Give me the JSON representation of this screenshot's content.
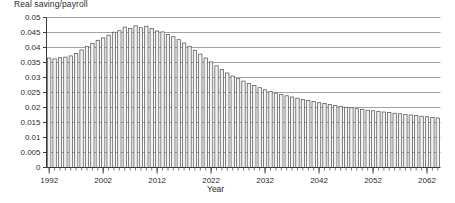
{
  "chart_data": {
    "type": "bar",
    "title": "Real saving/payroll",
    "subtitle": "",
    "xlabel": "Year",
    "ylabel": "",
    "grid": true,
    "legend": false,
    "ylim": [
      0,
      0.05
    ],
    "xlim": [
      1991.5,
      2064.5
    ],
    "ytick_labels": [
      "0",
      "0.005",
      "0.01",
      "0.015",
      "0.02",
      "0.025",
      "0.03",
      "0.035",
      "0.04",
      "0.045",
      "0.05"
    ],
    "ytick_values": [
      0,
      0.005,
      0.01,
      0.015,
      0.02,
      0.025,
      0.03,
      0.035,
      0.04,
      0.045,
      0.05
    ],
    "xtick_labels": [
      "1992",
      "2002",
      "2012",
      "2022",
      "2032",
      "2042",
      "2052",
      "2062"
    ],
    "xtick_values": [
      1992,
      2002,
      2012,
      2022,
      2032,
      2042,
      2052,
      2062
    ],
    "bar_fill": "#f2f2f2",
    "bar_stroke": "#4d4d4d",
    "grid_color": "#8c8c8c",
    "axis_color": "#3a3a3a",
    "categories": [
      1992,
      1993,
      1994,
      1995,
      1996,
      1997,
      1998,
      1999,
      2000,
      2001,
      2002,
      2003,
      2004,
      2005,
      2006,
      2007,
      2008,
      2009,
      2010,
      2011,
      2012,
      2013,
      2014,
      2015,
      2016,
      2017,
      2018,
      2019,
      2020,
      2021,
      2022,
      2023,
      2024,
      2025,
      2026,
      2027,
      2028,
      2029,
      2030,
      2031,
      2032,
      2033,
      2034,
      2035,
      2036,
      2037,
      2038,
      2039,
      2040,
      2041,
      2042,
      2043,
      2044,
      2045,
      2046,
      2047,
      2048,
      2049,
      2050,
      2051,
      2052,
      2053,
      2054,
      2055,
      2056,
      2057,
      2058,
      2059,
      2060,
      2061,
      2062,
      2063,
      2064
    ],
    "values": [
      0.0365,
      0.0362,
      0.0366,
      0.0368,
      0.0372,
      0.038,
      0.0392,
      0.0404,
      0.0414,
      0.0424,
      0.0432,
      0.0441,
      0.0451,
      0.0456,
      0.0468,
      0.0463,
      0.0472,
      0.0466,
      0.0471,
      0.0463,
      0.0455,
      0.0452,
      0.0443,
      0.0436,
      0.0426,
      0.0415,
      0.0404,
      0.0391,
      0.0378,
      0.0365,
      0.0352,
      0.0339,
      0.0327,
      0.0315,
      0.0305,
      0.0296,
      0.0288,
      0.028,
      0.0273,
      0.0266,
      0.0259,
      0.0253,
      0.0248,
      0.0243,
      0.0239,
      0.0235,
      0.0231,
      0.0227,
      0.0223,
      0.022,
      0.0216,
      0.0213,
      0.021,
      0.0207,
      0.0204,
      0.0201,
      0.0199,
      0.0196,
      0.0194,
      0.0191,
      0.0189,
      0.0187,
      0.0185,
      0.0183,
      0.0181,
      0.0179,
      0.0177,
      0.0175,
      0.0173,
      0.0171,
      0.0169,
      0.0167,
      0.0165
    ]
  }
}
